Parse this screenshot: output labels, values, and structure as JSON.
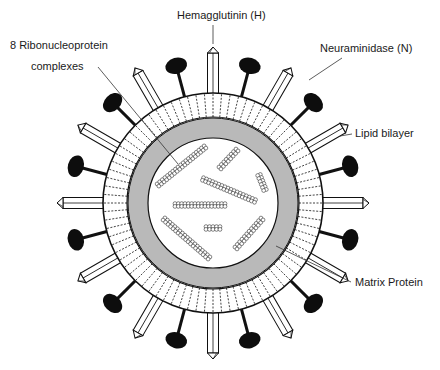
{
  "labels": {
    "hemagglutinin": "Hemagglutinin (H)",
    "neuraminidase": "Neuraminidase (N)",
    "rnp_line1": "8 Ribonucleoprotein",
    "rnp_line2": "complexes",
    "lipid_bilayer": "Lipid bilayer",
    "matrix_protein": "Matrix Protein"
  },
  "components": {
    "hemagglutinin_spike_count": 12,
    "neuraminidase_spike_count": 12,
    "ribonucleoprotein_complex_count": 8
  },
  "colors": {
    "line": "#111111",
    "matrix_fill": "#b9b9b9",
    "background": "#ffffff",
    "spike_fill": "#ffffff",
    "na_head": "#0d0d0d"
  }
}
